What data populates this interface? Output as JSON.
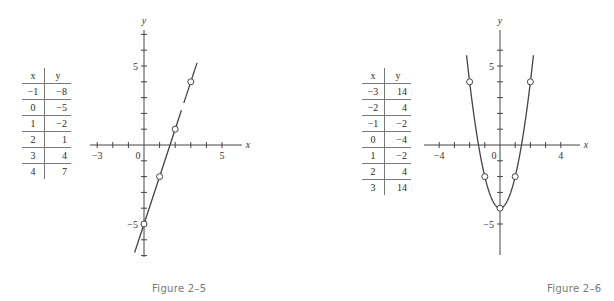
{
  "chart_data": [
    {
      "type": "line",
      "title": "Figure 2-5",
      "caption": "Figure  2–5",
      "equation_implied": "y = 3x - 5",
      "xlabel": "x",
      "ylabel": "y",
      "table": {
        "headers": [
          "x",
          "y"
        ],
        "rows": [
          [
            "−1",
            "−8"
          ],
          [
            "0",
            "−5"
          ],
          [
            "1",
            "−2"
          ],
          [
            "2",
            "1"
          ],
          [
            "3",
            "4"
          ],
          [
            "4",
            "7"
          ]
        ]
      },
      "x": [
        -1,
        0,
        1,
        2,
        3,
        4
      ],
      "values": [
        -8,
        -5,
        -2,
        1,
        4,
        7
      ],
      "plotted_points": [
        [
          0,
          -5
        ],
        [
          1,
          -2
        ],
        [
          2,
          1
        ],
        [
          3,
          4
        ]
      ],
      "tick_labels": {
        "x": [
          {
            "v": -3,
            "t": "−3"
          },
          {
            "v": 0,
            "t": "0"
          },
          {
            "v": 5,
            "t": "5"
          }
        ],
        "y": [
          {
            "v": 5,
            "t": "5"
          },
          {
            "v": -5,
            "t": "−5"
          }
        ]
      },
      "xlim": [
        -3.3,
        6.2
      ],
      "ylim": [
        -7,
        7
      ],
      "grid": false,
      "legend": "none"
    },
    {
      "type": "line",
      "title": "Figure 2-6",
      "caption": "Figure  2–6",
      "equation_implied": "y = 2x^2 - 4",
      "xlabel": "x",
      "ylabel": "y",
      "table": {
        "headers": [
          "x",
          "y"
        ],
        "rows": [
          [
            "−3",
            "14"
          ],
          [
            "−2",
            "4"
          ],
          [
            "−1",
            "−2"
          ],
          [
            "0",
            "−4"
          ],
          [
            "1",
            "−2"
          ],
          [
            "2",
            "4"
          ],
          [
            "3",
            "14"
          ]
        ]
      },
      "x": [
        -3,
        -2,
        -1,
        0,
        1,
        2,
        3
      ],
      "values": [
        14,
        4,
        -2,
        -4,
        -2,
        4,
        14
      ],
      "plotted_points": [
        [
          -2,
          4
        ],
        [
          -1,
          -2
        ],
        [
          0,
          -4
        ],
        [
          1,
          -2
        ],
        [
          2,
          4
        ]
      ],
      "tick_labels": {
        "x": [
          {
            "v": -4,
            "t": "−4"
          },
          {
            "v": 0,
            "t": "0"
          },
          {
            "v": 4,
            "t": "4"
          }
        ],
        "y": [
          {
            "v": 5,
            "t": "5"
          },
          {
            "v": -5,
            "t": "−5"
          }
        ]
      },
      "xlim": [
        -5,
        5.2
      ],
      "ylim": [
        -7,
        7
      ],
      "grid": false,
      "legend": "none"
    }
  ]
}
